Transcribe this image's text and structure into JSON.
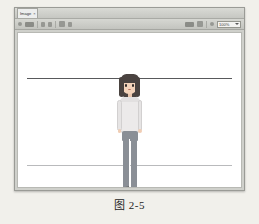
{
  "page": {
    "background_color": "#f1f0eb",
    "caption": "图 2-5"
  },
  "window": {
    "frame_color": "#cfd0cb",
    "title_bar": {
      "tab_label": "Image",
      "tab_close_icon": "close-icon",
      "extra_label": ""
    },
    "toolbar": {
      "items": [
        {
          "name": "menu-icon",
          "label": ""
        },
        {
          "name": "open-file-icon",
          "label": ""
        },
        {
          "name": "save-icon",
          "label": ""
        },
        {
          "name": "undo-icon",
          "label": ""
        },
        {
          "name": "redo-icon",
          "label": ""
        },
        {
          "name": "crop-icon",
          "label": ""
        },
        {
          "name": "rotate-icon",
          "label": ""
        },
        {
          "name": "print-icon",
          "label": ""
        },
        {
          "name": "settings-icon",
          "label": ""
        },
        {
          "name": "search-icon",
          "label": ""
        }
      ],
      "zoom_value": "100%",
      "zoom_caret_icon": "chevron-down-icon"
    },
    "canvas": {
      "background_color": "#ffffff",
      "guides": [
        {
          "name": "top-guide-line",
          "color": "#58595b",
          "position_pct": 29
        },
        {
          "name": "bottom-guide-line",
          "color": "#b9babc",
          "position_pct": 86
        }
      ]
    }
  },
  "character": {
    "description": "cartoon girl standing",
    "hair_color": "#4a4340",
    "skin_color": "#f3d3ba",
    "top_color": "#eceaea",
    "pants_color": "#8a8f96",
    "left_shoe_color": "#3a3532",
    "right_shoe_color": "#cfcdcb",
    "parts": [
      "hair-back",
      "face",
      "hair-front",
      "eyes",
      "mouth",
      "neck",
      "torso",
      "arms",
      "hands",
      "hips",
      "legs",
      "shoes"
    ]
  }
}
